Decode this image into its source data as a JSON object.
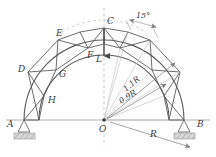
{
  "figure": {
    "type": "engineering-diagram",
    "background_color": "#ffffff",
    "line_color": "#555555",
    "thin_line_color": "#8a8a8a",
    "label_color": "#3b3b3b",
    "hatch_color": "#b9b9b9"
  },
  "geometry": {
    "center": {
      "x": 104,
      "y": 120,
      "label": "O"
    },
    "outer_radius_px": 80,
    "inner_radius_px": 65,
    "baseline_y": 120,
    "baseline_x_start": 6,
    "baseline_x_end": 210,
    "segment_angle_deg": 15
  },
  "nodes": [
    {
      "id": "A",
      "label": "A",
      "x": 16,
      "y": 126,
      "label_dx": -9,
      "label_dy": 1
    },
    {
      "id": "D",
      "label": "D",
      "x": 28,
      "y": 72,
      "label_dx": -10,
      "label_dy": 0
    },
    {
      "id": "H",
      "label": "H",
      "x": 44,
      "y": 96,
      "label_dx": 4,
      "label_dy": 7
    },
    {
      "id": "G",
      "label": "G",
      "x": 56,
      "y": 70,
      "label_dx": 3,
      "label_dy": 7
    },
    {
      "id": "E",
      "label": "E",
      "x": 58,
      "y": 40,
      "label_dx": -2,
      "label_dy": -4
    },
    {
      "id": "F",
      "label": "F",
      "x": 88,
      "y": 48,
      "label_dx": -1,
      "label_dy": 10
    },
    {
      "id": "C",
      "label": "C",
      "x": 104,
      "y": 28,
      "label_dx": 3,
      "label_dy": -4
    },
    {
      "id": "B",
      "label": "B",
      "x": 192,
      "y": 126,
      "label_dx": 5,
      "label_dy": 1
    }
  ],
  "load": {
    "label": "L",
    "label_x": 99,
    "label_y": 58,
    "arrow_x": 104,
    "arrow_top_y": 28,
    "arrow_bottom_y": 56,
    "direction": "down"
  },
  "dimensions": [
    {
      "id": "outer-radius",
      "label": "1.1R",
      "x": 133,
      "y": 88,
      "rotation": -40
    },
    {
      "id": "inner-radius",
      "label": "0.9R",
      "x": 130,
      "y": 99,
      "rotation": -32
    },
    {
      "id": "base-radius",
      "label": "R",
      "x": 152,
      "y": 136,
      "rotation": 0
    }
  ],
  "annotations": [
    {
      "id": "segment-angle",
      "label": "15°",
      "x": 149,
      "y": 16
    }
  ],
  "supports": [
    {
      "id": "support-left",
      "node": "A",
      "x": 24,
      "y": 126,
      "type": "pin-hatched"
    },
    {
      "id": "support-right",
      "node": "B",
      "x": 185,
      "y": 126,
      "type": "pin-hatched"
    }
  ]
}
